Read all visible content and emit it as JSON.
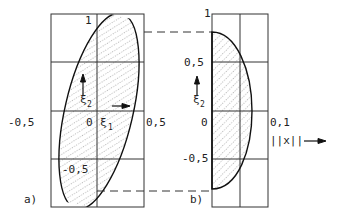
{
  "figure": {
    "panel_a": {
      "label": "a)",
      "y_top_label": "1",
      "x_left_label": "-0,5",
      "origin_label": "0",
      "x_right_label": "0,5",
      "y_bottom_label": "-0,5",
      "axis_x_symbol": "ξ",
      "axis_x_sub": "1",
      "axis_y_symbol": "ξ",
      "axis_y_sub": "2"
    },
    "panel_b": {
      "label": "b)",
      "y_top_label": "1",
      "y_mid_label": "0,5",
      "origin_label": "0",
      "y_bottom_label": "-0,5",
      "x_right_label": "0,1",
      "axis_x_label": "||x||",
      "axis_y_symbol": "ξ",
      "axis_y_sub": "2"
    },
    "colors": {
      "line": "#222222",
      "hatch": "#333333",
      "background": "#ffffff"
    }
  }
}
